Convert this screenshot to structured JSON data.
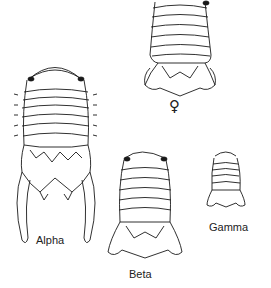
{
  "figure": {
    "specimens": [
      {
        "id": "alpha",
        "label": "Alpha"
      },
      {
        "id": "beta",
        "label": "Beta"
      },
      {
        "id": "gamma",
        "label": "Gamma"
      },
      {
        "id": "female",
        "symbol": "♀"
      }
    ],
    "colors": {
      "line": "#1a1a1a",
      "background": "#ffffff"
    }
  }
}
